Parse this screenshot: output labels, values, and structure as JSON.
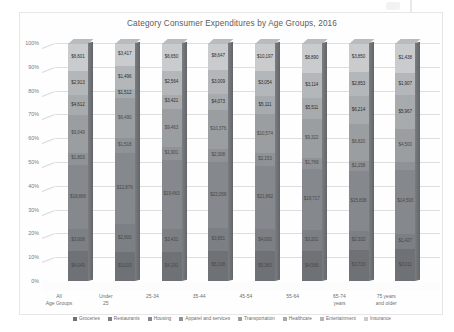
{
  "chart_data": {
    "type": "bar",
    "stacked": true,
    "normalized": "100%",
    "title": "Category Consumer Expenditures by Age Groups, 2016",
    "xlabel": "",
    "ylabel": "",
    "ylim": [
      0,
      100
    ],
    "ytick_labels": [
      "100%",
      "90%",
      "80%",
      "70%",
      "60%",
      "50%",
      "40%",
      "30%",
      "20%",
      "10%",
      "0%"
    ],
    "grid": true,
    "legend_position": "bottom",
    "categories": [
      "All\nAge Groups",
      "Under\n25",
      "25-34",
      "35-44",
      "45-54",
      "55-64",
      "65-74\nyears",
      "75 years\nand older"
    ],
    "series": [
      {
        "name": "Groceries",
        "color": "#6e7175",
        "values": [
          12.6,
          12.2,
          12.1,
          12.8,
          12.6,
          12.7,
          13.0,
          13.5
        ],
        "labels": [
          "$4,049",
          "$3,019",
          "$4,191",
          "$5,108",
          "$5,383",
          "$4,568",
          "$3,733",
          "$3,011"
        ]
      },
      {
        "name": "Restaurants",
        "color": "#7c7f83",
        "values": [
          9.1,
          11.6,
          9.9,
          9.6,
          9.4,
          8.9,
          8.1,
          6.4
        ],
        "labels": [
          "$3,008",
          "$2,900",
          "$3,431",
          "$3,851",
          "$4,000",
          "$3,201",
          "$2,332",
          "$1,427"
        ]
      },
      {
        "name": "Housing",
        "color": "#85888c",
        "values": [
          27.2,
          30.1,
          28.9,
          27.6,
          26.4,
          25.5,
          25.2,
          26.8
        ],
        "labels": [
          "$18,886",
          "$12,876",
          "$19,463",
          "$22,059",
          "$21,892",
          "$19,717",
          "$15,838",
          "$14,593"
        ]
      },
      {
        "name": "Apparel and services",
        "color": "#8f9296",
        "values": [
          5.0,
          6.0,
          5.4,
          5.4,
          5.2,
          4.6,
          4.0,
          3.3
        ],
        "labels": [
          "$1,803",
          "$1,518",
          "$1,901",
          "$2,308",
          "$2,153",
          "$1,769",
          "$1,158",
          "$702"
        ]
      },
      {
        "name": "Transportation",
        "color": "#9b9ea1",
        "values": [
          16.0,
          16.9,
          16.1,
          16.3,
          16.4,
          16.2,
          15.6,
          13.8
        ],
        "labels": [
          "$9,049",
          "$6,490",
          "$9,463",
          "$10,376",
          "$10,574",
          "$9,322",
          "$6,820",
          "$4,500"
        ]
      },
      {
        "name": "Healthcare",
        "color": "#a8abae",
        "values": [
          8.1,
          4.0,
          5.9,
          6.8,
          7.8,
          9.1,
          11.7,
          14.4
        ],
        "labels": [
          "$4,612",
          "$1,512",
          "$3,421",
          "$4,073",
          "$5,111",
          "$5,511",
          "$6,214",
          "$5,967"
        ]
      },
      {
        "name": "Entertainment",
        "color": "#b4b7ba",
        "values": [
          10.2,
          9.6,
          10.1,
          10.3,
          10.5,
          10.5,
          10.4,
          9.3
        ],
        "labels": [
          "$2,913",
          "$1,496",
          "$2,564",
          "$3,009",
          "$3,054",
          "$3,114",
          "$2,853",
          "$1,907"
        ]
      },
      {
        "name": "Insurance",
        "color": "#c9cbcd",
        "values": [
          11.8,
          9.6,
          11.6,
          11.2,
          11.7,
          12.5,
          12.0,
          12.5
        ],
        "labels": [
          "$6,601",
          "$3,417",
          "$6,650",
          "$8,647",
          "$10,197",
          "$8,890",
          "$3,850",
          "$1,438"
        ]
      }
    ]
  },
  "legend": {
    "items": [
      {
        "label": "Groceries"
      },
      {
        "label": "Restaurants"
      },
      {
        "label": "Housing"
      },
      {
        "label": "Apparel and services"
      },
      {
        "label": "Transportation"
      },
      {
        "label": "Healthcare"
      },
      {
        "label": "Entertainment"
      },
      {
        "label": "Insurance"
      }
    ]
  }
}
